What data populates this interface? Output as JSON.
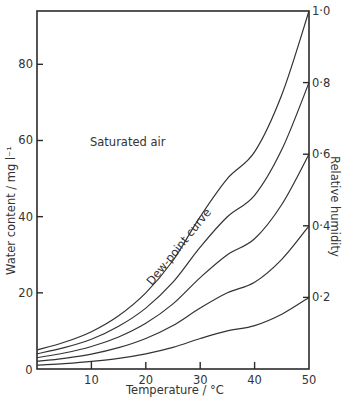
{
  "chart_data": {
    "type": "line",
    "title": "",
    "xlabel": "Temperature / °C",
    "ylabel": "Water content / mg l⁻¹",
    "y2label": "Relative humidity",
    "xlim": [
      0,
      50
    ],
    "ylim": [
      0,
      94
    ],
    "x_ticks": [
      10,
      20,
      30,
      40,
      50
    ],
    "x_tick_labels": [
      "10",
      "20",
      "30",
      "40",
      "50"
    ],
    "origin_label": "0",
    "y_ticks": [
      20,
      40,
      60,
      80
    ],
    "y_tick_labels": [
      "20",
      "40",
      "60",
      "80"
    ],
    "y2_tick_labels": [
      "1·0",
      "0·8",
      "0·6",
      "0·4",
      "0·2"
    ],
    "grid": false,
    "annotations": [
      {
        "text": "Saturated air",
        "x": 14,
        "y": 59
      },
      {
        "text": "Dew-point curve",
        "x": 24,
        "y": 29,
        "rotation": -47
      }
    ],
    "x": [
      0,
      5,
      10,
      15,
      20,
      25,
      30,
      35,
      40,
      45,
      50
    ],
    "series": [
      {
        "name": "1·0 (Dew-point curve)",
        "values": [
          5.0,
          7.0,
          9.8,
          14.0,
          20.0,
          28.5,
          40.0,
          50.0,
          57.0,
          72.0,
          94.0
        ]
      },
      {
        "name": "0·8",
        "values": [
          4.0,
          5.6,
          7.8,
          11.2,
          16.0,
          22.8,
          32.0,
          40.0,
          45.6,
          57.6,
          75.2
        ]
      },
      {
        "name": "0·6",
        "values": [
          3.0,
          4.2,
          5.9,
          8.4,
          12.0,
          17.1,
          24.0,
          30.0,
          34.2,
          43.2,
          56.4
        ]
      },
      {
        "name": "0·4",
        "values": [
          2.0,
          2.8,
          3.9,
          5.6,
          8.0,
          11.4,
          16.0,
          20.0,
          22.8,
          28.8,
          37.6
        ]
      },
      {
        "name": "0·2",
        "values": [
          1.0,
          1.4,
          2.0,
          2.8,
          4.0,
          5.7,
          8.0,
          10.0,
          11.4,
          14.4,
          18.8
        ]
      }
    ]
  }
}
